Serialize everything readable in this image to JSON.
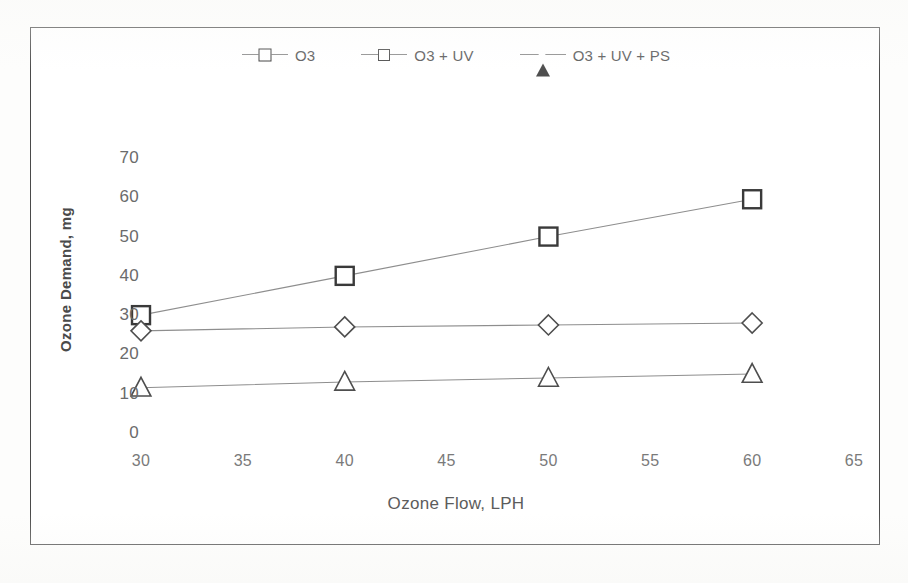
{
  "chart_data": {
    "type": "line",
    "title": "",
    "xlabel": "Ozone Flow, LPH",
    "ylabel": "Ozone Demand, mg",
    "x": [
      30,
      40,
      50,
      60
    ],
    "xlim": [
      30,
      65
    ],
    "ylim": [
      0,
      70
    ],
    "xticks": [
      "30",
      "35",
      "40",
      "45",
      "50",
      "55",
      "60",
      "65"
    ],
    "xtick_values": [
      30,
      35,
      40,
      45,
      50,
      55,
      60,
      65
    ],
    "yticks": [
      "0",
      "10",
      "20",
      "30",
      "40",
      "50",
      "60",
      "70"
    ],
    "ytick_values": [
      0,
      10,
      20,
      30,
      40,
      50,
      60,
      70
    ],
    "grid": false,
    "legend_position": "top-center",
    "series": [
      {
        "name": "O3",
        "marker": "square",
        "color": "#3a3a3a",
        "values": [
          30,
          40,
          50,
          59.5
        ]
      },
      {
        "name": "O3 + UV",
        "marker": "diamond",
        "color": "#4e4e4e",
        "values": [
          26,
          27,
          27.5,
          28
        ]
      },
      {
        "name": "O3 + UV + PS",
        "marker": "triangle",
        "color": "#4e4e4e",
        "values": [
          11.5,
          13,
          14,
          15
        ]
      }
    ]
  },
  "legend": {
    "items": [
      {
        "label": "O3"
      },
      {
        "label": "O3 + UV"
      },
      {
        "label": "O3 + UV + PS"
      }
    ]
  },
  "axes": {
    "x_title": "Ozone Flow, LPH",
    "y_title": "Ozone Demand, mg",
    "x_ticks": [
      "30",
      "35",
      "40",
      "45",
      "50",
      "55",
      "60",
      "65"
    ],
    "y_ticks": [
      "70",
      "60",
      "50",
      "40",
      "30",
      "20",
      "10",
      "0"
    ]
  },
  "colors": {
    "frame": "#4a4a4a",
    "line": "#8e8e8e",
    "marker_stroke": "#3a3a3a",
    "tick_text": "#6b6b6b",
    "axis_title": "#4a4a4a",
    "background": "#ffffff"
  }
}
